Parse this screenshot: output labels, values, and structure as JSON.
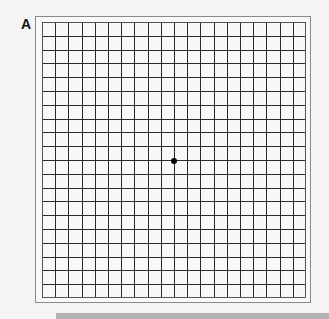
{
  "figure": {
    "panel_label": "A",
    "grid": {
      "columns": 20,
      "rows": 20,
      "width": 264,
      "height": 276,
      "line_color": "#2a2a2a",
      "border_color": "#555555"
    },
    "fixation_dot": {
      "cx": 132,
      "cy": 139,
      "r": 3,
      "color": "#000000"
    },
    "colors": {
      "background": "#f4f4f4",
      "frame": "#8a8a8a",
      "bottom_bar": "#b3b3b3"
    }
  }
}
